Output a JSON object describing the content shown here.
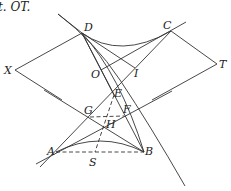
{
  "caption_fragment": "t. OT.",
  "points": {
    "D": {
      "label": "D",
      "x": 82,
      "y": 33
    },
    "C": {
      "label": "C",
      "x": 171,
      "y": 31
    },
    "X": {
      "label": "X",
      "x": 15,
      "y": 70
    },
    "T": {
      "label": "T",
      "x": 217,
      "y": 64
    },
    "O": {
      "label": "O",
      "x": 101,
      "y": 70
    },
    "I": {
      "label": "I",
      "x": 135,
      "y": 68
    },
    "E": {
      "label": "E",
      "x": 114,
      "y": 95
    },
    "G": {
      "label": "G",
      "x": 90,
      "y": 117
    },
    "F": {
      "label": "F",
      "x": 124,
      "y": 116
    },
    "H": {
      "label": "H",
      "x": 104,
      "y": 127
    },
    "A": {
      "label": "A",
      "x": 56,
      "y": 152
    },
    "B": {
      "label": "B",
      "x": 144,
      "y": 152
    },
    "S": {
      "label": "S",
      "x": 95,
      "y": 152
    }
  },
  "curves": [
    "upper hyperbola branch arc D–C",
    "lower hyperbola branch arc A–B",
    "long curve through D, B"
  ],
  "colors": {
    "stroke": "#333333",
    "background": "#ffffff"
  }
}
